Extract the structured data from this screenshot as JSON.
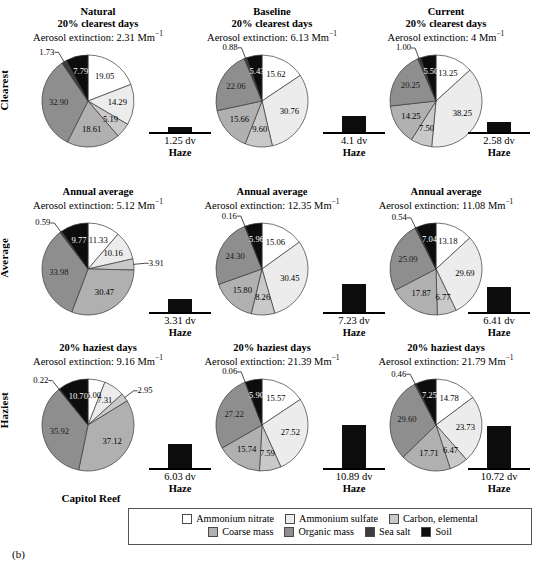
{
  "figure": {
    "tag": "(b)",
    "site_name": "Capitol Reef",
    "row_labels": [
      "Clearest",
      "Average",
      "Haziest"
    ],
    "haze_word": "Haze",
    "extinction_prefix": "Aerosol extinction: ",
    "extinction_unit": "Mm",
    "extinction_unit_exp": "−1"
  },
  "legend": {
    "rows": [
      [
        {
          "label": "Ammonium nitrate",
          "color": "#ffffff"
        },
        {
          "label": "Ammonium sulfate",
          "color": "#ececec"
        },
        {
          "label": "Carbon, elemental",
          "color": "#c9c9c9"
        }
      ],
      [
        {
          "label": "Coarse mass",
          "color": "#b0b0b0"
        },
        {
          "label": "Organic mass",
          "color": "#8e8e8e"
        },
        {
          "label": "Sea salt",
          "color": "#3d3d3d"
        },
        {
          "label": "Soil",
          "color": "#0d0d0d"
        }
      ]
    ]
  },
  "chart_data": {
    "type": "pie",
    "categories": [
      "Ammonium nitrate",
      "Ammonium sulfate",
      "Carbon, elemental",
      "Coarse mass",
      "Organic mass",
      "Sea salt",
      "Soil"
    ],
    "colors": [
      "#ffffff",
      "#ececec",
      "#c9c9c9",
      "#b0b0b0",
      "#8e8e8e",
      "#3d3d3d",
      "#0d0d0d"
    ],
    "units": "percent of aerosol extinction",
    "grid_rows": [
      "Clearest",
      "Average",
      "Haziest"
    ],
    "grid_columns": [
      "Natural",
      "Baseline",
      "Current"
    ],
    "panels": [
      {
        "row": "Clearest",
        "column": "Natural",
        "title": "Natural",
        "subtitle": "20% clearest days",
        "extinction": "2.31",
        "extinction_text": "Aerosol extinction: 2.31 Mm",
        "values": [
          19.05,
          14.29,
          5.19,
          18.61,
          32.9,
          1.73,
          7.79
        ],
        "haze_dv": "1.25 dv",
        "haze_value": 1.25
      },
      {
        "row": "Clearest",
        "column": "Baseline",
        "title": "Baseline",
        "subtitle": "20% clearest days",
        "extinction": "6.13",
        "extinction_text": "Aerosol extinction: 6.13 Mm",
        "values": [
          15.62,
          30.76,
          9.6,
          15.66,
          22.06,
          0.88,
          5.43
        ],
        "haze_dv": "4.1 dv",
        "haze_value": 4.1
      },
      {
        "row": "Clearest",
        "column": "Current",
        "title": "Current",
        "subtitle": "20% clearest days",
        "extinction": "4",
        "extinction_text": "Aerosol extinction: 4 Mm",
        "values": [
          13.25,
          38.25,
          7.5,
          14.25,
          20.25,
          1.0,
          5.5
        ],
        "haze_dv": "2.58 dv",
        "haze_value": 2.58
      },
      {
        "row": "Average",
        "column": "Natural",
        "title": "",
        "subtitle": "Annual average",
        "extinction": "5.12",
        "extinction_text": "Aerosol extinction: 5.12 Mm",
        "values": [
          11.33,
          10.16,
          3.91,
          30.47,
          33.98,
          0.59,
          9.77
        ],
        "haze_dv": "3.31 dv",
        "haze_value": 3.31
      },
      {
        "row": "Average",
        "column": "Baseline",
        "title": "",
        "subtitle": "Annual average",
        "extinction": "12.35",
        "extinction_text": "Aerosol extinction: 12.35 Mm",
        "values": [
          15.06,
          30.45,
          8.26,
          15.8,
          24.3,
          0.16,
          5.96
        ],
        "haze_dv": "7.23 dv",
        "haze_value": 7.23
      },
      {
        "row": "Average",
        "column": "Current",
        "title": "",
        "subtitle": "Annual average",
        "extinction": "11.08",
        "extinction_text": "Aerosol extinction: 11.08 Mm",
        "values": [
          13.18,
          29.69,
          6.77,
          17.87,
          25.09,
          0.54,
          7.04
        ],
        "haze_dv": "6.41 dv",
        "haze_value": 6.41
      },
      {
        "row": "Haziest",
        "column": "Natural",
        "title": "",
        "subtitle": "20% haziest days",
        "extinction": "9.16",
        "extinction_text": "Aerosol extinction: 9.16 Mm",
        "values": [
          6.0,
          7.31,
          2.95,
          37.12,
          35.92,
          0.22,
          10.7
        ],
        "haze_dv": "6.03 dv",
        "haze_value": 6.03
      },
      {
        "row": "Haziest",
        "column": "Baseline",
        "title": "",
        "subtitle": "20% haziest days",
        "extinction": "21.39",
        "extinction_text": "Aerosol extinction: 21.39 Mm",
        "values": [
          15.57,
          27.52,
          7.59,
          15.74,
          27.22,
          0.06,
          5.9
        ],
        "haze_dv": "10.89 dv",
        "haze_value": 10.89
      },
      {
        "row": "Haziest",
        "column": "Current",
        "title": "",
        "subtitle": "20% haziest days",
        "extinction": "21.79",
        "extinction_text": "Aerosol extinction: 21.79 Mm",
        "values": [
          14.78,
          23.73,
          6.47,
          17.71,
          29.6,
          0.46,
          7.25
        ],
        "haze_dv": "10.72 dv",
        "haze_value": 10.72
      }
    ]
  }
}
